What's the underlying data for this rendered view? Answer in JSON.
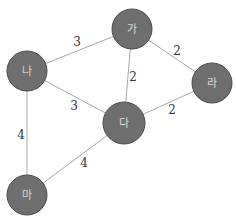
{
  "graph": {
    "nodes": [
      {
        "id": "ga",
        "label": "가",
        "x": 132,
        "y": 29,
        "r": 20
      },
      {
        "id": "na",
        "label": "나",
        "x": 27,
        "y": 71,
        "r": 20
      },
      {
        "id": "ra",
        "label": "라",
        "x": 212,
        "y": 83,
        "r": 20
      },
      {
        "id": "da",
        "label": "다",
        "x": 124,
        "y": 123,
        "r": 21
      },
      {
        "id": "ma",
        "label": "마",
        "x": 27,
        "y": 195,
        "r": 20
      }
    ],
    "edges": [
      {
        "from": "na",
        "to": "ga",
        "weight": "3",
        "lx": 77,
        "ly": 42
      },
      {
        "from": "ga",
        "to": "ra",
        "weight": "2",
        "lx": 177,
        "ly": 51
      },
      {
        "from": "ga",
        "to": "da",
        "weight": "2",
        "lx": 133,
        "ly": 77
      },
      {
        "from": "na",
        "to": "da",
        "weight": "3",
        "lx": 74,
        "ly": 106
      },
      {
        "from": "da",
        "to": "ra",
        "weight": "2",
        "lx": 172,
        "ly": 110
      },
      {
        "from": "na",
        "to": "ma",
        "weight": "4",
        "lx": 21,
        "ly": 135
      },
      {
        "from": "da",
        "to": "ma",
        "weight": "4",
        "lx": 84,
        "ly": 163
      }
    ],
    "colors": {
      "node_fill": "#6f6f6f",
      "node_stroke": "#4a4a4a",
      "node_text": "#d8d8d8",
      "edge": "#a8a8a8",
      "weight_text": "#333333"
    }
  }
}
